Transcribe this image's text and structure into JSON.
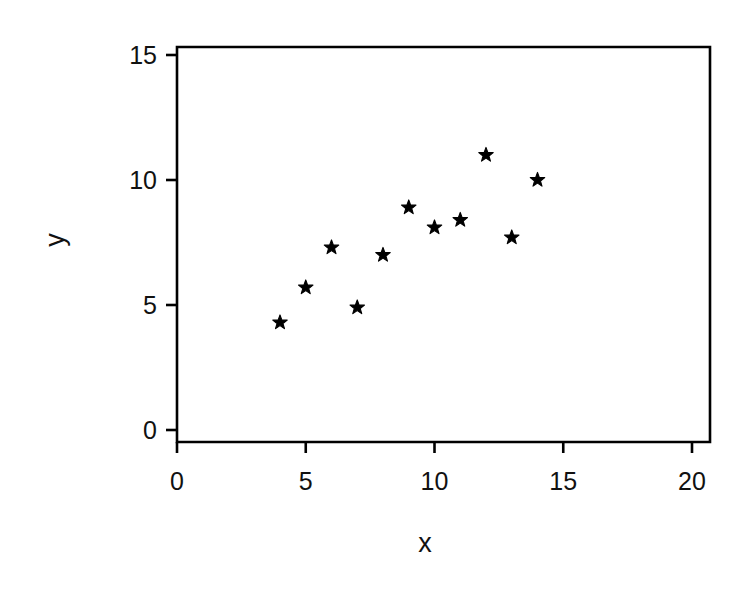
{
  "chart_data": {
    "type": "scatter",
    "title": "",
    "xlabel": "x",
    "ylabel": "y",
    "xlim": [
      0,
      21.2
    ],
    "ylim": [
      0,
      15.4
    ],
    "xticks": [
      0,
      5,
      10,
      15,
      20
    ],
    "yticks": [
      0,
      5,
      10,
      15
    ],
    "xtick_labels": [
      "0",
      "5",
      "10",
      "15",
      "20"
    ],
    "ytick_labels": [
      "0",
      "5",
      "10",
      "15"
    ],
    "grid": false,
    "legend": null,
    "marker": "star",
    "marker_color": "#000000",
    "frame_color": "#000000",
    "background": "#ffffff",
    "x": [
      4,
      5,
      6,
      7,
      8,
      9,
      10,
      11,
      12,
      13,
      14
    ],
    "y": [
      4.3,
      5.7,
      7.3,
      4.9,
      7.0,
      8.9,
      8.1,
      8.4,
      11.0,
      7.7,
      10.0
    ],
    "points": [
      {
        "x": 4,
        "y": 4.3
      },
      {
        "x": 5,
        "y": 5.7
      },
      {
        "x": 6,
        "y": 7.3
      },
      {
        "x": 7,
        "y": 4.9
      },
      {
        "x": 8,
        "y": 7.0
      },
      {
        "x": 9,
        "y": 8.9
      },
      {
        "x": 10,
        "y": 8.1
      },
      {
        "x": 11,
        "y": 8.4
      },
      {
        "x": 12,
        "y": 11.0
      },
      {
        "x": 13,
        "y": 7.7
      },
      {
        "x": 14,
        "y": 10.0
      }
    ]
  },
  "axes": {
    "x_title": "x",
    "y_title": "y"
  }
}
